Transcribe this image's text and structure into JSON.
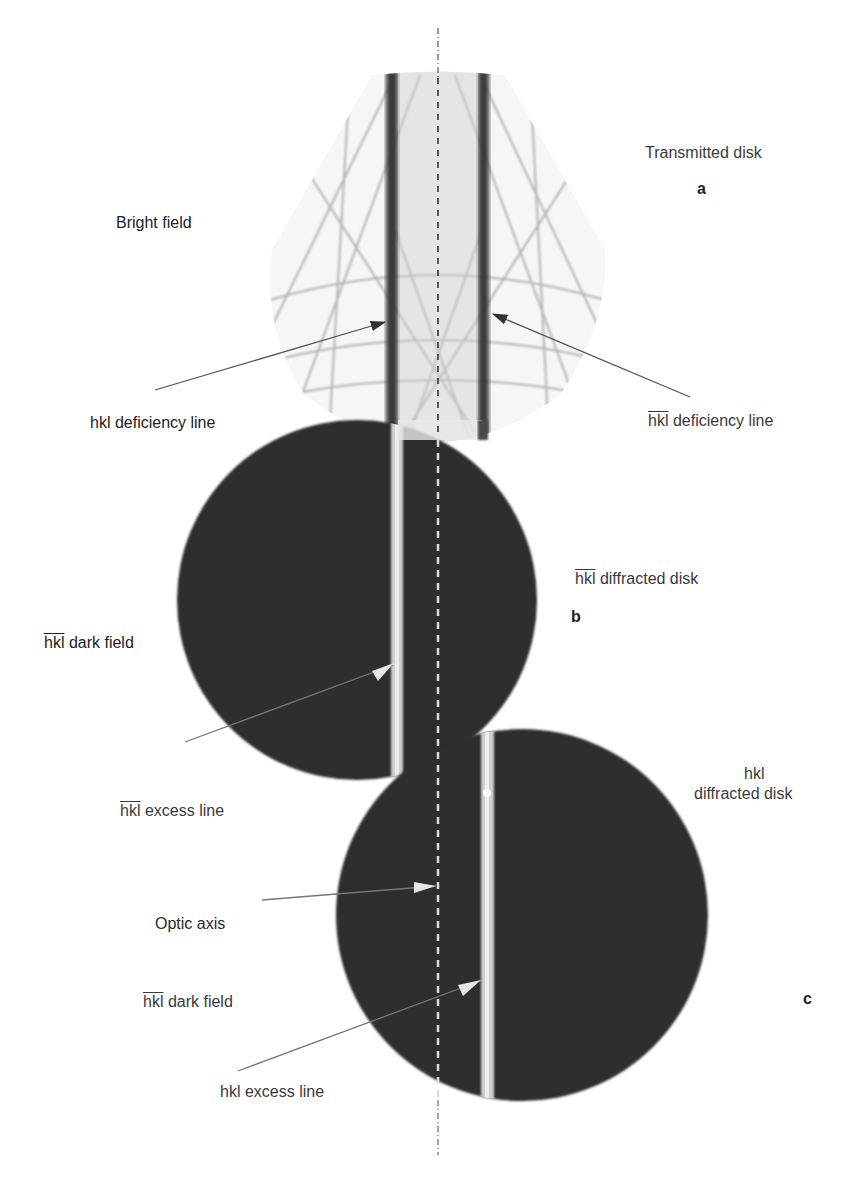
{
  "figure": {
    "panels": [
      {
        "id": "a",
        "letter": "a",
        "disk_label": "Transmitted disk",
        "field_label": "Bright field",
        "left_arrow_label_prefix": "hkl",
        "left_arrow_label_suffix": " deficiency line",
        "right_arrow_label_prefix": "hkl",
        "right_arrow_label_suffix": " deficiency line"
      },
      {
        "id": "b",
        "letter": "b",
        "disk_label_prefix": "hkl",
        "disk_label_suffix": " diffracted disk",
        "field_label_prefix": "hkl",
        "field_label_suffix": " dark field",
        "excess_label_prefix": "hkl",
        "excess_label_suffix": " excess line"
      },
      {
        "id": "c",
        "letter": "c",
        "disk_label_line1": "hkl",
        "disk_label_line2": "diffracted disk",
        "optic_axis_label": "Optic axis",
        "field_label_prefix": "hkl",
        "field_label_suffix": " dark field",
        "excess_label": "hkl excess line"
      }
    ],
    "colors": {
      "background": "#ffffff",
      "dark_disk": "#2e2e2e",
      "excess_line": "#d8d8d8",
      "deficiency_line": "#3a3a3a",
      "kikuchi_lines": "#9a9a9a",
      "text": "#333333"
    }
  }
}
